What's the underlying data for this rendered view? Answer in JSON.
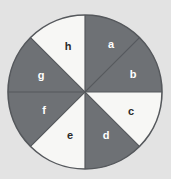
{
  "figure": {
    "name": "spinner-wheel",
    "background_color": "#e3e3e3",
    "outline_color": "#55585c"
  },
  "chart_data": {
    "type": "pie",
    "title": "",
    "subtitle": "",
    "xlabel": "",
    "ylabel": "",
    "legend_position": "none",
    "grid": false,
    "equal_sectors": true,
    "sector_count": 8,
    "sector_angle_degrees": 45,
    "start_angle_degrees": 0,
    "direction": "clockwise",
    "categories": [
      "a",
      "b",
      "c",
      "d",
      "e",
      "f",
      "g",
      "h"
    ],
    "values": [
      12.5,
      12.5,
      12.5,
      12.5,
      12.5,
      12.5,
      12.5,
      12.5
    ],
    "colors": [
      "#6e7175",
      "#6e7175",
      "#f7f7f5",
      "#6e7175",
      "#f7f7f5",
      "#6e7175",
      "#6e7175",
      "#f7f7f5"
    ],
    "label_colors": [
      "#ffffff",
      "#ffffff",
      "#2b2b2b",
      "#ffffff",
      "#2b2b2b",
      "#ffffff",
      "#ffffff",
      "#2b2b2b"
    ],
    "sectors": [
      {
        "label": "a",
        "start_deg": 0,
        "end_deg": 45,
        "fill": "#6e7175",
        "label_fill": "#ffffff",
        "label_x": 111,
        "label_y": 48
      },
      {
        "label": "b",
        "start_deg": 45,
        "end_deg": 90,
        "fill": "#6e7175",
        "label_fill": "#ffffff",
        "label_x": 133,
        "label_y": 78
      },
      {
        "label": "c",
        "start_deg": 90,
        "end_deg": 135,
        "fill": "#f7f7f5",
        "label_fill": "#2b2b2b",
        "label_x": 131,
        "label_y": 115
      },
      {
        "label": "d",
        "start_deg": 135,
        "end_deg": 180,
        "fill": "#6e7175",
        "label_fill": "#ffffff",
        "label_x": 106,
        "label_y": 139
      },
      {
        "label": "e",
        "start_deg": 180,
        "end_deg": 225,
        "fill": "#f7f7f5",
        "label_fill": "#2b2b2b",
        "label_x": 70,
        "label_y": 139
      },
      {
        "label": "f",
        "start_deg": 225,
        "end_deg": 270,
        "fill": "#6e7175",
        "label_fill": "#ffffff",
        "label_x": 44,
        "label_y": 114
      },
      {
        "label": "g",
        "start_deg": 270,
        "end_deg": 315,
        "fill": "#6e7175",
        "label_fill": "#ffffff",
        "label_x": 41,
        "label_y": 79
      },
      {
        "label": "h",
        "start_deg": 315,
        "end_deg": 360,
        "fill": "#f7f7f5",
        "label_fill": "#2b2b2b",
        "label_x": 68,
        "label_y": 50
      }
    ],
    "geometry": {
      "center_x": 85,
      "center_y": 92,
      "radius": 77
    }
  }
}
